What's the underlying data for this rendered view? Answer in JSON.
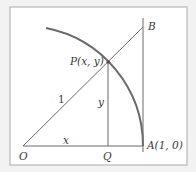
{
  "figure": {
    "points": {
      "P": "P(x, y)",
      "B": "B",
      "A": "A(1, 0)",
      "O": "O",
      "Q": "Q"
    },
    "segment_labels": {
      "hypotenuse": "1",
      "vertical": "y",
      "horizontal": "x"
    },
    "colors": {
      "background": "#f2f2f2",
      "frame_fill": "#ffffff",
      "frame_stroke": "#b8b8b8",
      "line": "#6a6a6a",
      "arc": "#6a6a6a"
    }
  }
}
